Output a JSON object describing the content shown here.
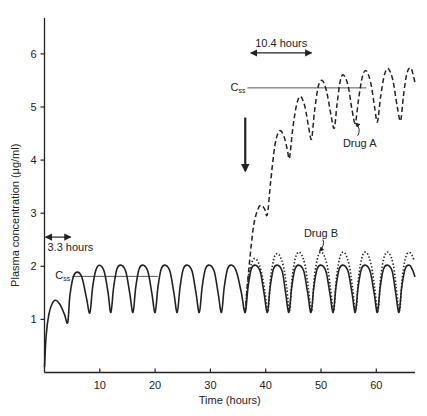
{
  "chart_data": {
    "type": "line",
    "title": "",
    "xlabel": "Time (hours)",
    "ylabel": "Plasma concentration (μg/ml)",
    "xlim": [
      0,
      67
    ],
    "ylim": [
      0,
      6.6
    ],
    "grid": false,
    "x_ticks": [
      10,
      20,
      30,
      40,
      50,
      60
    ],
    "y_ticks": [
      1,
      2,
      3,
      4,
      5,
      6
    ],
    "series": [
      {
        "name": "Solid (Drug B baseline, 3.3 h half-life)",
        "style": "solid",
        "points": [
          [
            0,
            0.1
          ],
          [
            0.3,
            0.7
          ],
          [
            0.8,
            1.1
          ],
          [
            1.4,
            1.3
          ],
          [
            2.0,
            1.36
          ],
          [
            2.8,
            1.28
          ],
          [
            3.6,
            1.1
          ],
          [
            4.2,
            0.94
          ],
          [
            4.6,
            1.45
          ],
          [
            5.2,
            1.8
          ],
          [
            6.0,
            1.89
          ],
          [
            6.8,
            1.78
          ],
          [
            7.6,
            1.4
          ],
          [
            8.2,
            1.12
          ],
          [
            8.7,
            1.6
          ],
          [
            9.3,
            1.93
          ],
          [
            10.0,
            2.02
          ],
          [
            10.8,
            1.9
          ],
          [
            11.5,
            1.5
          ],
          [
            12.0,
            1.13
          ],
          [
            12.5,
            1.6
          ],
          [
            13.1,
            1.95
          ],
          [
            13.9,
            2.02
          ],
          [
            14.7,
            1.9
          ],
          [
            15.4,
            1.5
          ],
          [
            16.0,
            1.13
          ],
          [
            16.5,
            1.6
          ],
          [
            17.1,
            1.95
          ],
          [
            17.9,
            2.02
          ],
          [
            18.7,
            1.9
          ],
          [
            19.4,
            1.5
          ],
          [
            20.0,
            1.13
          ],
          [
            20.5,
            1.6
          ],
          [
            21.1,
            1.95
          ],
          [
            21.9,
            2.02
          ],
          [
            22.7,
            1.9
          ],
          [
            23.4,
            1.5
          ],
          [
            24.0,
            1.13
          ],
          [
            24.5,
            1.6
          ],
          [
            25.1,
            1.95
          ],
          [
            25.9,
            2.02
          ],
          [
            26.7,
            1.9
          ],
          [
            27.4,
            1.5
          ],
          [
            28.0,
            1.13
          ],
          [
            28.5,
            1.6
          ],
          [
            29.1,
            1.95
          ],
          [
            29.9,
            2.02
          ],
          [
            30.7,
            1.9
          ],
          [
            31.4,
            1.5
          ],
          [
            32.0,
            1.13
          ],
          [
            32.5,
            1.6
          ],
          [
            33.1,
            1.95
          ],
          [
            33.9,
            2.02
          ],
          [
            34.7,
            1.9
          ],
          [
            35.6,
            1.5
          ],
          [
            36.3,
            1.13
          ],
          [
            36.8,
            1.6
          ],
          [
            37.4,
            1.95
          ],
          [
            38.2,
            2.02
          ],
          [
            39.0,
            1.9
          ],
          [
            39.7,
            1.5
          ],
          [
            40.3,
            1.13
          ],
          [
            40.8,
            1.6
          ],
          [
            41.4,
            1.95
          ],
          [
            42.2,
            2.02
          ],
          [
            43.0,
            1.9
          ],
          [
            43.6,
            1.5
          ],
          [
            44.2,
            1.13
          ],
          [
            44.7,
            1.6
          ],
          [
            45.3,
            1.95
          ],
          [
            46.1,
            2.02
          ],
          [
            46.9,
            1.9
          ],
          [
            47.6,
            1.5
          ],
          [
            48.2,
            1.13
          ],
          [
            48.7,
            1.6
          ],
          [
            49.3,
            1.95
          ],
          [
            50.1,
            2.02
          ],
          [
            50.9,
            1.9
          ],
          [
            51.6,
            1.5
          ],
          [
            52.2,
            1.13
          ],
          [
            52.7,
            1.6
          ],
          [
            53.3,
            1.95
          ],
          [
            54.1,
            2.02
          ],
          [
            54.9,
            1.9
          ],
          [
            55.6,
            1.5
          ],
          [
            56.2,
            1.13
          ],
          [
            56.7,
            1.6
          ],
          [
            57.3,
            1.95
          ],
          [
            58.1,
            2.02
          ],
          [
            58.9,
            1.9
          ],
          [
            59.6,
            1.5
          ],
          [
            60.2,
            1.13
          ],
          [
            60.7,
            1.6
          ],
          [
            61.3,
            1.95
          ],
          [
            62.1,
            2.02
          ],
          [
            62.9,
            1.9
          ],
          [
            63.5,
            1.5
          ],
          [
            64.1,
            1.13
          ],
          [
            64.6,
            1.6
          ],
          [
            65.2,
            1.95
          ],
          [
            66.0,
            2.02
          ],
          [
            66.6,
            1.92
          ],
          [
            67.0,
            1.8
          ]
        ]
      },
      {
        "name": "Drug B",
        "style": "dotted",
        "points": [
          [
            36.3,
            1.13
          ],
          [
            36.8,
            1.75
          ],
          [
            37.6,
            2.1
          ],
          [
            38.4,
            2.12
          ],
          [
            39.2,
            1.9
          ],
          [
            39.9,
            1.5
          ],
          [
            40.4,
            1.15
          ],
          [
            40.9,
            1.8
          ],
          [
            41.6,
            2.18
          ],
          [
            42.4,
            2.22
          ],
          [
            43.2,
            2.0
          ],
          [
            43.8,
            1.6
          ],
          [
            44.3,
            1.16
          ],
          [
            44.8,
            1.8
          ],
          [
            45.5,
            2.2
          ],
          [
            46.3,
            2.25
          ],
          [
            47.1,
            2.02
          ],
          [
            47.7,
            1.6
          ],
          [
            48.3,
            1.16
          ],
          [
            48.8,
            1.8
          ],
          [
            49.5,
            2.2
          ],
          [
            50.3,
            2.25
          ],
          [
            51.1,
            2.02
          ],
          [
            51.7,
            1.6
          ],
          [
            52.3,
            1.16
          ],
          [
            52.8,
            1.8
          ],
          [
            53.5,
            2.2
          ],
          [
            54.3,
            2.25
          ],
          [
            55.1,
            2.02
          ],
          [
            55.7,
            1.6
          ],
          [
            56.3,
            1.16
          ],
          [
            56.8,
            1.8
          ],
          [
            57.5,
            2.2
          ],
          [
            58.3,
            2.25
          ],
          [
            59.1,
            2.02
          ],
          [
            59.7,
            1.6
          ],
          [
            60.3,
            1.16
          ],
          [
            60.8,
            1.8
          ],
          [
            61.5,
            2.2
          ],
          [
            62.3,
            2.25
          ],
          [
            63.1,
            2.02
          ],
          [
            63.6,
            1.6
          ],
          [
            64.2,
            1.16
          ],
          [
            64.7,
            1.8
          ],
          [
            65.4,
            2.2
          ],
          [
            66.2,
            2.25
          ],
          [
            66.8,
            2.12
          ]
        ]
      },
      {
        "name": "Drug A",
        "style": "dashed",
        "points": [
          [
            36.3,
            1.13
          ],
          [
            37.0,
            2.0
          ],
          [
            37.8,
            2.75
          ],
          [
            38.6,
            3.08
          ],
          [
            39.2,
            3.15
          ],
          [
            39.8,
            3.08
          ],
          [
            40.3,
            2.98
          ],
          [
            40.9,
            3.6
          ],
          [
            41.7,
            4.3
          ],
          [
            42.5,
            4.55
          ],
          [
            43.3,
            4.45
          ],
          [
            43.9,
            4.2
          ],
          [
            44.3,
            4.04
          ],
          [
            44.9,
            4.6
          ],
          [
            45.6,
            5.05
          ],
          [
            46.3,
            5.2
          ],
          [
            47.1,
            5.0
          ],
          [
            47.8,
            4.6
          ],
          [
            48.3,
            4.4
          ],
          [
            48.8,
            4.9
          ],
          [
            49.5,
            5.38
          ],
          [
            50.2,
            5.5
          ],
          [
            51.0,
            5.3
          ],
          [
            51.8,
            4.85
          ],
          [
            52.4,
            4.6
          ],
          [
            52.9,
            5.05
          ],
          [
            53.5,
            5.5
          ],
          [
            54.1,
            5.6
          ],
          [
            54.9,
            5.4
          ],
          [
            55.6,
            4.95
          ],
          [
            56.2,
            4.7
          ],
          [
            56.8,
            5.15
          ],
          [
            57.5,
            5.58
          ],
          [
            58.2,
            5.68
          ],
          [
            59.0,
            5.45
          ],
          [
            59.7,
            5.0
          ],
          [
            60.2,
            4.72
          ],
          [
            60.8,
            5.2
          ],
          [
            61.5,
            5.62
          ],
          [
            62.2,
            5.72
          ],
          [
            63.0,
            5.5
          ],
          [
            63.8,
            5.0
          ],
          [
            64.4,
            4.74
          ],
          [
            64.9,
            5.2
          ],
          [
            65.5,
            5.62
          ],
          [
            66.2,
            5.74
          ],
          [
            66.8,
            5.55
          ],
          [
            67.0,
            5.45
          ]
        ]
      }
    ],
    "reference_lines": [
      {
        "label": "Css",
        "y": 1.81,
        "x_range": [
          5.0,
          20.5
        ]
      },
      {
        "label": "Css",
        "y": 5.36,
        "x_range": [
          36.7,
          58.2
        ]
      }
    ],
    "annotations": {
      "half_life_b": {
        "text": "3.3 hours",
        "y": 2.55,
        "x_range": [
          0,
          3.3
        ]
      },
      "half_life_a": {
        "text": "10.4 hours",
        "y": 6.0,
        "x_range": [
          37.3,
          48.3
        ]
      },
      "drug_a_label": {
        "text": "Drug A",
        "at": [
          57.0,
          4.25
        ],
        "points_to": [
          56.2,
          4.7
        ]
      },
      "drug_b_label": {
        "text": "Drug B",
        "at": [
          50.0,
          2.56
        ],
        "points_to": [
          49.7,
          2.28
        ]
      },
      "switch_arrow": {
        "x": 36.3,
        "y_from": 4.8,
        "y_to": 3.8
      }
    },
    "legend": "none"
  }
}
